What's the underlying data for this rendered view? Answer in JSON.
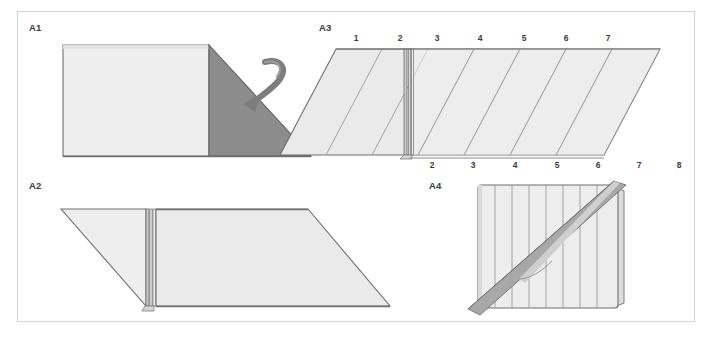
{
  "figure": {
    "background_color": "#ffffff",
    "frame_border_color": "#d3d3d3",
    "panel_count": 4
  },
  "colors": {
    "paper_light": "#eeeeee",
    "paper_light_alt": "#e8e8e8",
    "paper_mid": "#dcdcdc",
    "paper_shadow": "#8f8f8f",
    "dark_face": "#8c8c8c",
    "outline": "#6f6f6f",
    "crease_line": "#9a9a9a",
    "arrow": "#7d7d7d",
    "label_text": "#3a3a3a"
  },
  "panels": [
    {
      "id": "A1",
      "label": "A1",
      "description": "Rectangle with dark triangular flap on the right and a curved fold-over arrow",
      "shapes": {
        "light_rectangle": "light gray rectangle left portion",
        "dark_triangle": "mid gray right triangle flap",
        "arrow": "curved fold-down arrow pointing into the triangle"
      },
      "tick_labels_top": [],
      "tick_labels_bottom": []
    },
    {
      "id": "A2",
      "label": "A2",
      "description": "Parallelogram folded flat with a narrow vertical pleat band near the left third",
      "shapes": {
        "left_triangle": "light gray triangular flap",
        "right_parallelogram": "light gray parallelogram body",
        "pleat_band": "narrow vertical folded band"
      },
      "tick_labels_top": [],
      "tick_labels_bottom": []
    },
    {
      "id": "A3",
      "label": "A3",
      "description": "Parallelogram with parallel diagonal crease lines, numbered along top and bottom edges",
      "shapes": {
        "parallelogram": "light gray parallelogram with diagonal creases",
        "pleat_band": "narrow vertical folded band near the left third"
      },
      "tick_labels_top": [
        "1",
        "2",
        "3",
        "4",
        "5",
        "6",
        "7"
      ],
      "tick_labels_bottom": [
        "2",
        "3",
        "4",
        "5",
        "6",
        "7",
        "8"
      ]
    },
    {
      "id": "A4",
      "label": "A4",
      "description": "Square of pleated paper with vertical fold lines and a diagonal gray strip across it",
      "shapes": {
        "pleated_square": "square with eight vertical pleat lines",
        "diagonal_strip": "gray diagonal strip from lower left to upper right",
        "back_flap": "thin flap visible at the right edge"
      },
      "tick_labels_top": [],
      "tick_labels_bottom": []
    }
  ]
}
